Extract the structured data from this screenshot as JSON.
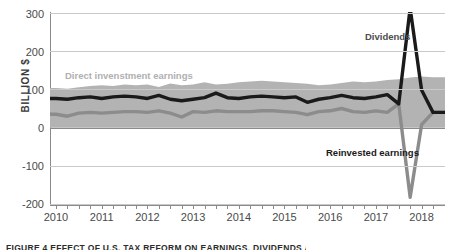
{
  "chart_data": {
    "type": "area",
    "title": "",
    "xlabel": "",
    "ylabel": "BILLION $",
    "ylim": [
      -200,
      300
    ],
    "yticks": [
      300,
      200,
      100,
      0,
      -100,
      -200
    ],
    "ytick_labels": [
      "300",
      "200",
      "100",
      "0",
      "-100",
      "-200"
    ],
    "grid": true,
    "legend_position": "in-chart annotations",
    "xlim": [
      "2010Q1",
      "2018Q2"
    ],
    "xtick_labels": [
      "2010",
      "2011",
      "2012",
      "2013",
      "2014",
      "2015",
      "2016",
      "2017",
      "2018"
    ],
    "x_minor_ticks_per_year": 4,
    "x": [
      "2010Q1",
      "2010Q2",
      "2010Q3",
      "2010Q4",
      "2011Q1",
      "2011Q2",
      "2011Q3",
      "2011Q4",
      "2012Q1",
      "2012Q2",
      "2012Q3",
      "2012Q4",
      "2013Q1",
      "2013Q2",
      "2013Q3",
      "2013Q4",
      "2014Q1",
      "2014Q2",
      "2014Q3",
      "2014Q4",
      "2015Q1",
      "2015Q2",
      "2015Q3",
      "2015Q4",
      "2016Q1",
      "2016Q2",
      "2016Q3",
      "2016Q4",
      "2017Q1",
      "2017Q2",
      "2017Q3",
      "2017Q4",
      "2018Q1",
      "2018Q2"
    ],
    "series": [
      {
        "name": "Direct invenstment earnings",
        "kind": "band",
        "color": "#b3b3b3",
        "label_color": "#b0b0b0",
        "values": [
          103,
          101,
          105,
          108,
          110,
          108,
          112,
          110,
          112,
          106,
          115,
          110,
          112,
          118,
          112,
          114,
          118,
          120,
          122,
          120,
          118,
          116,
          114,
          110,
          112,
          116,
          120,
          118,
          120,
          124,
          126,
          130,
          133,
          131
        ],
        "baseline": 0
      },
      {
        "name": "Dividends",
        "kind": "line",
        "color": "#1a1a1a",
        "values": [
          76,
          74,
          78,
          80,
          76,
          80,
          82,
          80,
          76,
          84,
          74,
          70,
          74,
          78,
          90,
          78,
          76,
          80,
          82,
          80,
          78,
          80,
          66,
          74,
          78,
          84,
          78,
          76,
          80,
          86,
          62,
          310,
          98,
          40
        ],
        "annotation": "Dividends"
      },
      {
        "name": "Reinvested earnings",
        "kind": "line",
        "color": "#8c8c8c",
        "values": [
          35,
          30,
          38,
          40,
          38,
          40,
          42,
          42,
          40,
          44,
          38,
          28,
          42,
          40,
          44,
          42,
          42,
          42,
          44,
          44,
          42,
          40,
          34,
          42,
          44,
          50,
          42,
          40,
          44,
          40,
          62,
          -180,
          8,
          40
        ],
        "annotation": "Reinvested earnings"
      }
    ],
    "notes": {
      "spike_quarter": "2017Q4",
      "dividends_peak": 310,
      "reinvested_trough": -180
    }
  },
  "annotations": {
    "band_label": "Direct invenstment earnings",
    "dividends_label": "Dividends",
    "reinvested_label": "Reinvested earnings"
  },
  "caption": {
    "text": "FIGURE 4  EFFECT OF U.S. TAX REFORM ON EARNINGS, DIVIDENDS AND REINVESTMENT"
  }
}
